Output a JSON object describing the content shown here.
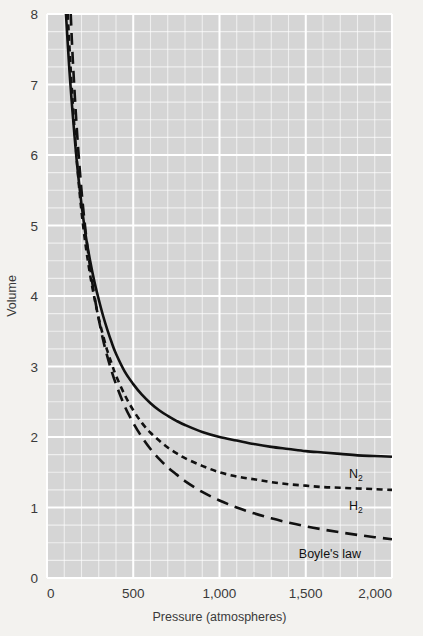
{
  "chart_data": {
    "type": "line",
    "title": "",
    "xlabel": "Pressure (atmospheres)",
    "ylabel": "Volume",
    "xlim": [
      0,
      2000
    ],
    "ylim": [
      0,
      8
    ],
    "xticks": [
      0,
      500,
      1000,
      1500,
      2000
    ],
    "xtick_labels": [
      "0",
      "500",
      "1,000",
      "1,500",
      "2,000"
    ],
    "yticks": [
      0,
      1,
      2,
      3,
      4,
      5,
      6,
      7,
      8
    ],
    "ytick_labels": [
      "0",
      "1",
      "2",
      "3",
      "4",
      "5",
      "6",
      "7",
      "8"
    ],
    "grid": true,
    "grid_minor": true,
    "grid_color": "#ffffff",
    "plot_background": "#d5d5d5",
    "page_background": "#f3f2ef",
    "legend": "inline-labels",
    "series": [
      {
        "name": "N2",
        "label": "N",
        "label_sub": "2",
        "style": "solid",
        "color": "#111111",
        "label_x": 1790,
        "label_y": 1.42,
        "x": [
          110,
          130,
          150,
          175,
          200,
          225,
          250,
          275,
          300,
          325,
          350,
          375,
          400,
          450,
          500,
          550,
          600,
          650,
          700,
          750,
          800,
          900,
          1000,
          1100,
          1200,
          1300,
          1400,
          1500,
          1600,
          1700,
          1800,
          1900,
          2000
        ],
        "y": [
          8.0,
          7.2,
          6.55,
          5.85,
          5.3,
          4.85,
          4.5,
          4.2,
          3.95,
          3.72,
          3.52,
          3.34,
          3.18,
          2.93,
          2.75,
          2.6,
          2.48,
          2.38,
          2.3,
          2.23,
          2.17,
          2.07,
          2.0,
          1.95,
          1.9,
          1.86,
          1.83,
          1.8,
          1.78,
          1.76,
          1.74,
          1.73,
          1.72
        ]
      },
      {
        "name": "H2",
        "label": "H",
        "label_sub": "2",
        "style": "dashed-short",
        "color": "#111111",
        "label_x": 1790,
        "label_y": 0.97,
        "x": [
          120,
          140,
          160,
          180,
          200,
          225,
          250,
          275,
          300,
          325,
          350,
          375,
          400,
          450,
          500,
          550,
          600,
          650,
          700,
          750,
          800,
          900,
          1000,
          1100,
          1200,
          1300,
          1400,
          1500,
          1600,
          1700,
          1800,
          1900,
          2000
        ],
        "y": [
          8.0,
          7.1,
          6.35,
          5.72,
          5.2,
          4.7,
          4.3,
          3.97,
          3.68,
          3.44,
          3.22,
          3.04,
          2.87,
          2.6,
          2.38,
          2.2,
          2.06,
          1.95,
          1.85,
          1.77,
          1.7,
          1.59,
          1.5,
          1.44,
          1.4,
          1.36,
          1.33,
          1.31,
          1.29,
          1.28,
          1.27,
          1.26,
          1.25
        ]
      },
      {
        "name": "Boyle's law",
        "label": "Boyle's law",
        "label_sub": "",
        "style": "dashed-long",
        "color": "#111111",
        "label_x": 1640,
        "label_y": 0.28,
        "x": [
          137.5,
          150,
          175,
          200,
          225,
          250,
          275,
          300,
          325,
          350,
          375,
          400,
          450,
          500,
          550,
          600,
          650,
          700,
          750,
          800,
          900,
          1000,
          1100,
          1200,
          1300,
          1400,
          1500,
          1600,
          1700,
          1800,
          1900,
          2000
        ],
        "y": [
          8.0,
          7.33,
          6.29,
          5.5,
          4.89,
          4.4,
          4.0,
          3.67,
          3.38,
          3.14,
          2.93,
          2.75,
          2.44,
          2.2,
          2.0,
          1.83,
          1.69,
          1.57,
          1.47,
          1.375,
          1.22,
          1.1,
          1.0,
          0.917,
          0.846,
          0.786,
          0.733,
          0.688,
          0.647,
          0.611,
          0.579,
          0.55
        ]
      }
    ]
  },
  "axes": {
    "x_title": "Pressure (atmospheres)",
    "y_title": "Volume"
  }
}
